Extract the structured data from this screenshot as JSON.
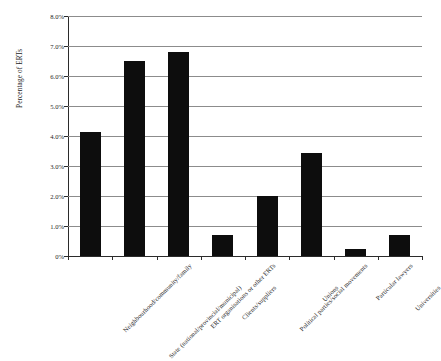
{
  "chart_data": {
    "type": "bar",
    "title": "",
    "xlabel": "",
    "ylabel": "Percentage of ERTs",
    "ylim": [
      0,
      8
    ],
    "yticks": [
      "0%",
      "1.0%",
      "2.0%",
      "3.0%",
      "4.0%",
      "5.0%",
      "6.0%",
      "7.0%",
      "8.0%"
    ],
    "ytick_values": [
      0,
      1,
      2,
      3,
      4,
      5,
      6,
      7,
      8
    ],
    "grid": true,
    "legend": "none",
    "bar_color": "#0d0d0d",
    "categories": [
      "Neighbourhood/community/family",
      "State (national/provincial/municipal)",
      "ERT organisations or other ERTs",
      "Clients/suppliers",
      "Political parties/social movements",
      "Unions",
      "Particular lawyers",
      "Universities"
    ],
    "values": [
      4.15,
      6.5,
      6.8,
      0.7,
      2.0,
      3.45,
      0.25,
      0.7
    ]
  },
  "axis": {
    "y_title": "Percentage of ERTs"
  }
}
